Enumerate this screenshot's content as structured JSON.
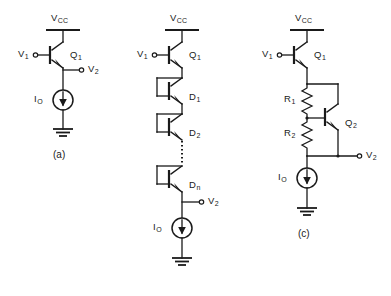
{
  "figure": {
    "background_color": "#ffffff",
    "ink_color": "#1a1a1a",
    "width": 391,
    "height": 296,
    "panels": [
      {
        "id": "a",
        "caption": "(a)",
        "supply_label": "V",
        "supply_sub": "CC",
        "input_label": "V",
        "input_sub": "1",
        "output_label": "V",
        "output_sub": "2",
        "transistor_label": "Q",
        "transistor_sub": "1",
        "current_source_label": "I",
        "current_source_sub": "O",
        "devices": [
          "Q1"
        ],
        "description": "emitter follower with current source bias"
      },
      {
        "id": "b",
        "caption": "",
        "supply_label": "V",
        "supply_sub": "CC",
        "input_label": "V",
        "input_sub": "1",
        "output_label": "V",
        "output_sub": "2",
        "transistor_label": "Q",
        "transistor_sub": "1",
        "current_source_label": "I",
        "current_source_sub": "O",
        "diodes": [
          {
            "label": "D",
            "sub": "1"
          },
          {
            "label": "D",
            "sub": "2"
          },
          {
            "label": "D",
            "sub": "n"
          }
        ],
        "ellipsis": "vertical-dotted",
        "description": "emitter follower with series diode-connected transistor level shift"
      },
      {
        "id": "c",
        "caption": "(c)",
        "supply_label": "V",
        "supply_sub": "CC",
        "input_label": "V",
        "input_sub": "1",
        "output_label": "V",
        "output_sub": "2",
        "transistor_label": "Q",
        "transistor_sub": "1",
        "transistor2_label": "Q",
        "transistor2_sub": "2",
        "resistors": [
          {
            "label": "R",
            "sub": "1"
          },
          {
            "label": "R",
            "sub": "2"
          }
        ],
        "current_source_label": "I",
        "current_source_sub": "O",
        "description": "emitter follower with VBE multiplier level shift"
      }
    ]
  }
}
